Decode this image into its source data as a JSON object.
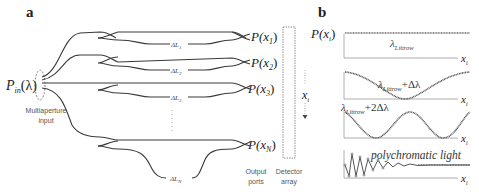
{
  "panel_a": {
    "label": "a",
    "input": {
      "P": "P",
      "sub": "in",
      "arg": "(λ)",
      "caption_line1": "Multiaperture",
      "caption_line2": "input"
    },
    "delays": [
      {
        "text": "ΔL",
        "sub": "1"
      },
      {
        "text": "ΔL",
        "sub": "2"
      },
      {
        "text": "ΔL",
        "sub": "3"
      },
      {
        "text": "ΔL",
        "sub": "N"
      }
    ],
    "outputs": [
      {
        "text": "P(x",
        "sub": "1",
        "close": ")"
      },
      {
        "text": "P(x",
        "sub": "2",
        "close": ")"
      },
      {
        "text": "P(x",
        "sub": "3",
        "close": ")"
      },
      {
        "text": "P(x",
        "sub": "N",
        "close": ")"
      }
    ],
    "ellipsis": "⋮",
    "output_ports_line1": "Output",
    "output_ports_line2": "ports",
    "detector_line1": "Detector",
    "detector_line2": "array",
    "axis_label": "x",
    "axis_sub": "i"
  },
  "panel_b": {
    "label": "b",
    "ylabel": "P(x",
    "ylabel_sub": "i",
    "ylabel_close": ")",
    "xlabel": "x",
    "xlabel_sub": "i",
    "plots": [
      {
        "lambda": "λ",
        "sub": "Littrow",
        "suffix": ""
      },
      {
        "lambda": "λ",
        "sub": "Littrow",
        "suffix": "+Δλ"
      },
      {
        "lambda": "λ",
        "sub": "Littrow",
        "suffix": "+2Δλ"
      },
      {
        "caption": "polychromatic light"
      }
    ]
  },
  "colors": {
    "line": "#3a3a3a",
    "text": "#222222",
    "caption": "#555555",
    "dotted": "#777777"
  }
}
